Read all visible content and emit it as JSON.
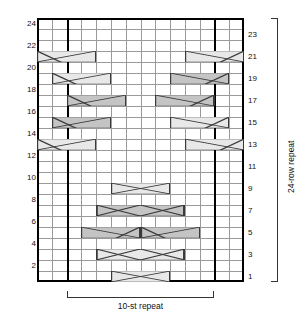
{
  "chart": {
    "type": "knitting-chart",
    "columns": 14,
    "rows": 24,
    "stitch_repeat_label": "10-st repeat",
    "row_repeat_label": "24-row repeat",
    "repeat_start_column": 2,
    "repeat_end_column": 12,
    "grid_line_color": "#9a9a9a",
    "border_color": "#000000",
    "cable_fill_light": "#e8e8e8",
    "cable_fill_dark": "#c4c4c4",
    "row_numbers_left": [
      24,
      22,
      20,
      18,
      16,
      14,
      12,
      10,
      8,
      6,
      4,
      2
    ],
    "row_numbers_right": [
      23,
      21,
      19,
      17,
      15,
      13,
      11,
      9,
      7,
      5,
      3,
      1
    ]
  },
  "chart_data": {
    "type": "table",
    "xlabel": "10-st repeat",
    "ylabel": "24-row repeat",
    "grid": "on",
    "columns": 14,
    "rows": 24,
    "categories": [
      "1",
      "2",
      "3",
      "4",
      "5",
      "6",
      "7",
      "8",
      "9",
      "10",
      "11",
      "12",
      "13",
      "14"
    ],
    "row_labels_left": [
      24,
      22,
      20,
      18,
      16,
      14,
      12,
      10,
      8,
      6,
      4,
      2
    ],
    "row_labels_right": [
      23,
      21,
      19,
      17,
      15,
      13,
      11,
      9,
      7,
      5,
      3,
      1
    ],
    "cables": [
      {
        "row": 21,
        "col": 0,
        "span": 4,
        "shade": "light",
        "cross": "right",
        "note": "left edge cable row 21"
      },
      {
        "row": 21,
        "col": 10,
        "span": 4,
        "shade": "light",
        "cross": "left",
        "note": "right edge cable row 21"
      },
      {
        "row": 19,
        "col": 1,
        "span": 4,
        "shade": "light",
        "cross": "right"
      },
      {
        "row": 19,
        "col": 9,
        "span": 4,
        "shade": "dark",
        "cross": "left"
      },
      {
        "row": 17,
        "col": 2,
        "span": 4,
        "shade": "dark",
        "cross": "right"
      },
      {
        "row": 17,
        "col": 8,
        "span": 4,
        "shade": "dark",
        "cross": "left"
      },
      {
        "row": 15,
        "col": 1,
        "span": 4,
        "shade": "dark",
        "cross": "right"
      },
      {
        "row": 15,
        "col": 9,
        "span": 4,
        "shade": "light",
        "cross": "left"
      },
      {
        "row": 13,
        "col": 0,
        "span": 4,
        "shade": "light",
        "cross": "right"
      },
      {
        "row": 13,
        "col": 10,
        "span": 4,
        "shade": "light",
        "cross": "left"
      },
      {
        "row": 9,
        "col": 5,
        "span": 4,
        "shade": "light",
        "cross": "center"
      },
      {
        "row": 7,
        "col": 4,
        "span": 6,
        "shade": "dark",
        "cross": "center-wide"
      },
      {
        "row": 5,
        "col": 3,
        "span": 4,
        "shade": "dark",
        "cross": "left"
      },
      {
        "row": 5,
        "col": 7,
        "span": 4,
        "shade": "dark",
        "cross": "right"
      },
      {
        "row": 3,
        "col": 4,
        "span": 6,
        "shade": "light",
        "cross": "center-wide"
      },
      {
        "row": 1,
        "col": 5,
        "span": 4,
        "shade": "light",
        "cross": "center"
      }
    ],
    "annotations": [
      {
        "text": "10-st repeat",
        "position": "bottom"
      },
      {
        "text": "24-row repeat",
        "position": "right",
        "rotation": -90
      }
    ]
  }
}
